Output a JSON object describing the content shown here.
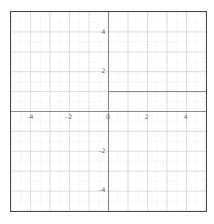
{
  "figure": {
    "title": "",
    "background_color": "#ffffff",
    "frame_color": "#4a4a4a",
    "major_grid_color": "#cfcfcf",
    "minor_grid_color": "#f0f0f0",
    "axis_color": "#8a8a8a",
    "curve_color": "#7a7a7a",
    "label_color": "#6b6b6b"
  },
  "chart_data": {
    "type": "line",
    "title": "",
    "xlabel": "",
    "ylabel": "",
    "xlim": [
      -5,
      5
    ],
    "ylim": [
      -5,
      5
    ],
    "grid": true,
    "minor_grid": true,
    "major_tick_step": 1,
    "minor_tick_step": 0.5,
    "legend": null,
    "legend_position": "none",
    "x_tick_labels": [
      {
        "value": -4,
        "text": "-4"
      },
      {
        "value": -2,
        "text": "-2"
      },
      {
        "value": 0,
        "text": "0"
      },
      {
        "value": 2,
        "text": "2"
      },
      {
        "value": 4,
        "text": "4"
      }
    ],
    "y_tick_labels": [
      {
        "value": 4,
        "text": "4"
      },
      {
        "value": 2,
        "text": "2"
      },
      {
        "value": -2,
        "text": "-2"
      },
      {
        "value": -4,
        "text": "-4"
      }
    ],
    "series": [
      {
        "name": "ray",
        "type": "line",
        "color": "#7a7a7a",
        "width": 0.9,
        "x": [
          0,
          5
        ],
        "values": [
          1,
          1
        ],
        "description": "horizontal ray y = 1 from x = 0 to the right edge"
      }
    ]
  }
}
